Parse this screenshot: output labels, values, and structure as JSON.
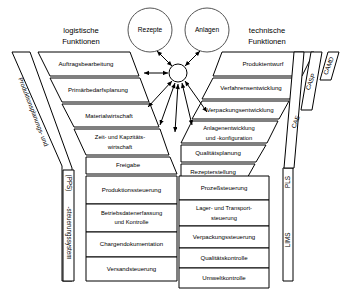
{
  "diagram": {
    "headers": {
      "left": "logistische\nFunktionen",
      "left_line1": "logistische",
      "left_line2": "Funktionen",
      "right_line1": "technische",
      "right_line2": "Funktionen"
    },
    "circles": [
      {
        "label": "Rezepte"
      },
      {
        "label": "Anlagen"
      }
    ],
    "hub": {
      "label": ""
    },
    "left_upper_blocks": [
      {
        "line1": "Auftragsbearbeitung",
        "line2": ""
      },
      {
        "line1": "Primärbedarfsplanung",
        "line2": ""
      },
      {
        "line1": "Materialwirtschaft",
        "line2": ""
      },
      {
        "line1": "Zeit- und Kapzitäts-",
        "line2": "wirtschaft"
      },
      {
        "line1": "Freigabe",
        "line2": ""
      }
    ],
    "right_upper_blocks": [
      {
        "line1": "Produktentwurf",
        "line2": ""
      },
      {
        "line1": "Verfahrensentwicklung",
        "line2": ""
      },
      {
        "line1": "Verpackungsentwicklung",
        "line2": ""
      },
      {
        "line1": "Anlagenentwicklung",
        "line2": "und -konfiguration"
      },
      {
        "line1": "Qualitätsplanung",
        "line2": ""
      },
      {
        "line1": "Rezepterstellung",
        "line2": ""
      }
    ],
    "left_lower_blocks": [
      {
        "line1": "Produktionssteuerung",
        "line2": ""
      },
      {
        "line1": "Betriebsdatenerfassung",
        "line2": "und Kontrolle"
      },
      {
        "line1": "Chargendokumentation",
        "line2": ""
      },
      {
        "line1": "Versandsteuerung",
        "line2": ""
      }
    ],
    "right_lower_blocks": [
      {
        "line1": "Prozeßsteuerung",
        "line2": ""
      },
      {
        "line1": "Lager- und Transport-",
        "line2": "steuerung"
      },
      {
        "line1": "Verpackungssteuerung",
        "line2": ""
      },
      {
        "line1": "Qualitätskontrolle",
        "line2": ""
      },
      {
        "line1": "Umweltkontrolle",
        "line2": ""
      }
    ],
    "left_side_bands": {
      "diagonal": "Produktionsplanungs- und",
      "vertical_top": "(PPS)",
      "vertical_bottom": "-steuerungssystem"
    },
    "right_side_bands": {
      "diagonal_outer": "CAMD",
      "diagonal_middle": "CASP",
      "diagonal_inner": "CAE",
      "vertical_top": "PLS",
      "vertical_bottom": "LIMS"
    },
    "watermark": "",
    "colors": {
      "stroke": "#000000",
      "background": "#ffffff",
      "circle_stroke": "#555555"
    }
  }
}
